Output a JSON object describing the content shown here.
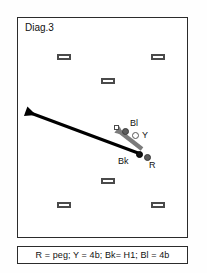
{
  "diagram": {
    "title": "Diag.3",
    "court": {
      "hoops": [
        {
          "name": "hoop-top-left",
          "x": 39,
          "y": 36
        },
        {
          "name": "hoop-top-right",
          "x": 133,
          "y": 36
        },
        {
          "name": "hoop-upper-center",
          "x": 83,
          "y": 60
        },
        {
          "name": "hoop-lower-center",
          "x": 83,
          "y": 160
        },
        {
          "name": "hoop-bottom-left",
          "x": 39,
          "y": 184
        },
        {
          "name": "hoop-bottom-right",
          "x": 133,
          "y": 184
        }
      ],
      "balls": [
        {
          "id": "Bl",
          "label": "Bl",
          "kind": "dark",
          "x": 104,
          "y": 110,
          "label_x": 112,
          "label_y": 101
        },
        {
          "id": "Y",
          "label": "Y",
          "kind": "open",
          "x": 114,
          "y": 114,
          "label_x": 124,
          "label_y": 113
        },
        {
          "id": "Bk",
          "label": "Bk",
          "kind": "black",
          "x": 118,
          "y": 133,
          "label_x": 100,
          "label_y": 139
        },
        {
          "id": "R",
          "label": "R",
          "kind": "dark",
          "x": 126,
          "y": 136,
          "label_x": 131,
          "label_y": 143
        }
      ],
      "markers": [
        {
          "name": "marker-square-bl",
          "x": 96,
          "y": 107
        }
      ],
      "arrows": [
        {
          "name": "main-shot-arrow",
          "color": "#000000",
          "x1": 120,
          "y1": 135,
          "x2": 18,
          "y2": 97,
          "width": 3.2,
          "head": 11
        },
        {
          "name": "ball-path-arrow",
          "color": "#7b7b7b",
          "x1": 124,
          "y1": 131,
          "x2": 106,
          "y2": 117,
          "width": 4.2,
          "head": 9
        }
      ]
    },
    "legend": {
      "text": "R = peg;  Y = 4b;  Bk= H1;  Bl = 4b",
      "entries": [
        {
          "ball": "R",
          "value": "peg"
        },
        {
          "ball": "Y",
          "value": "4b"
        },
        {
          "ball": "Bk",
          "value": "H1"
        },
        {
          "ball": "Bl",
          "value": "4b"
        }
      ]
    }
  },
  "colors": {
    "line": "#2b2b2b",
    "hoop": "#4a4a4a",
    "ball_dark": "#5d5d5d",
    "ball_black": "#121212",
    "arrow_main": "#000000",
    "arrow_secondary": "#7b7b7b"
  }
}
